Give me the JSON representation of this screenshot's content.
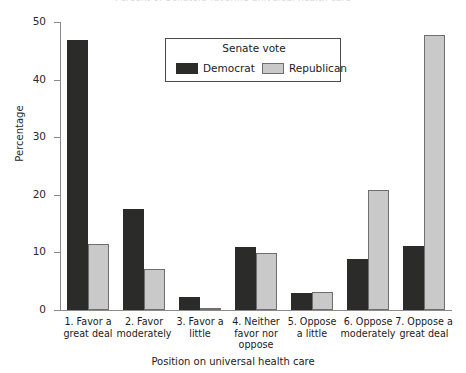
{
  "chart_data": {
    "type": "bar",
    "title": "Percent of Senators favoring universal health care",
    "xlabel": "Position on universal health care",
    "ylabel": "Percentage",
    "ylim": [
      0,
      50
    ],
    "yticks": [
      0,
      10,
      20,
      30,
      40,
      50
    ],
    "grid": false,
    "legend_position": "upper center",
    "legend_title": "Senate vote",
    "categories": [
      "1. Favor a\ngreat deal",
      "2. Favor\nmoderately",
      "3. Favor a\nlittle",
      "4. Neither\nfavor nor\noppose",
      "5. Oppose\na little",
      "6. Oppose\nmoderately",
      "7. Oppose a\ngreat deal"
    ],
    "series": [
      {
        "name": "Democrat",
        "color": "#2b2b29",
        "values": [
          46.8,
          17.5,
          2.3,
          11.0,
          2.9,
          8.8,
          11.2
        ]
      },
      {
        "name": "Republican",
        "color": "#c9c9c9",
        "values": [
          11.5,
          7.1,
          0.3,
          9.9,
          3.2,
          20.8,
          47.7
        ]
      }
    ]
  },
  "colors": {
    "democrat": "#2b2b29",
    "republican": "#c9c9c9",
    "republican_edge": "#6e6e6e",
    "axis": "#8a8a8a",
    "background": "#ffffff"
  }
}
